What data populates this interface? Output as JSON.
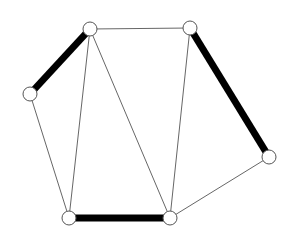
{
  "diagram": {
    "type": "graph",
    "colors": {
      "background": "#ffffff",
      "edge": "#555555",
      "thick_edge": "#000000",
      "node_fill": "#ffffff",
      "node_stroke": "#555555"
    },
    "node_radius": 7,
    "nodes": [
      {
        "id": "A",
        "x": 90,
        "y": 29
      },
      {
        "id": "B",
        "x": 190,
        "y": 28
      },
      {
        "id": "C",
        "x": 30,
        "y": 94
      },
      {
        "id": "D",
        "x": 269,
        "y": 157
      },
      {
        "id": "E",
        "x": 69,
        "y": 218
      },
      {
        "id": "F",
        "x": 170,
        "y": 218
      }
    ],
    "edges": [
      {
        "from": "A",
        "to": "B",
        "weight": "thin"
      },
      {
        "from": "A",
        "to": "C",
        "weight": "thick"
      },
      {
        "from": "A",
        "to": "E",
        "weight": "thin"
      },
      {
        "from": "A",
        "to": "F",
        "weight": "thin"
      },
      {
        "from": "C",
        "to": "E",
        "weight": "thin"
      },
      {
        "from": "B",
        "to": "F",
        "weight": "thin"
      },
      {
        "from": "B",
        "to": "D",
        "weight": "thick"
      },
      {
        "from": "D",
        "to": "F",
        "weight": "thin"
      },
      {
        "from": "E",
        "to": "F",
        "weight": "thick"
      }
    ]
  }
}
